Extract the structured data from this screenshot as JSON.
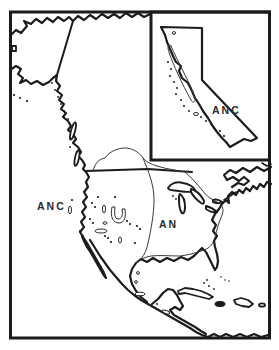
{
  "map": {
    "type": "species-distribution-map",
    "area": "North America",
    "labels": {
      "west": "ANC",
      "east": "AN",
      "inset": "ANC"
    },
    "inset": {
      "area": "California"
    },
    "colors": {
      "line": "#1b1b1b",
      "thin_line": "#3a3a3a",
      "label": "#2b2b2b",
      "background": "#ffffff"
    }
  }
}
